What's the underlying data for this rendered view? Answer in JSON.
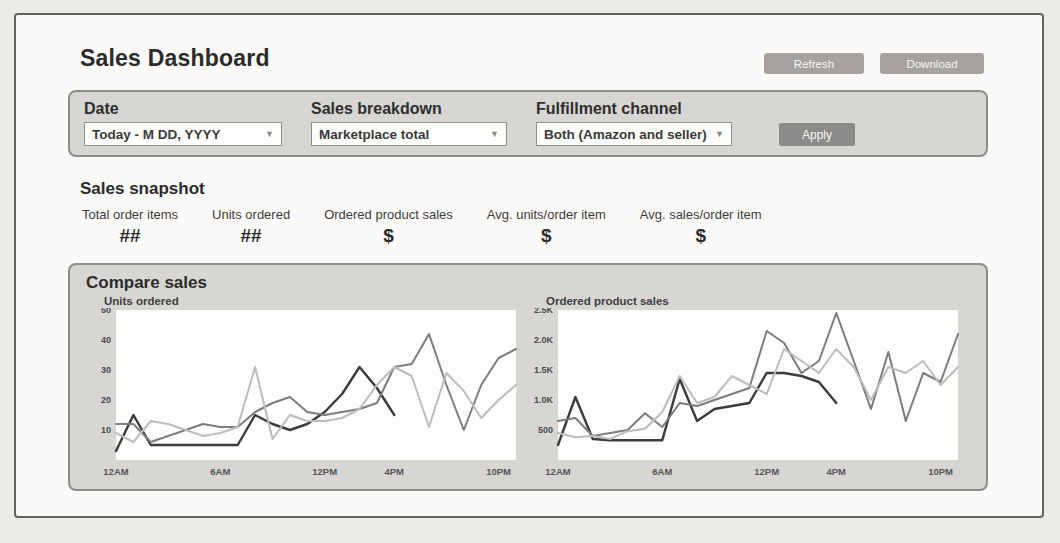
{
  "page": {
    "title": "Sales Dashboard"
  },
  "header": {
    "refresh_label": "Refresh",
    "download_label": "Download"
  },
  "filters": {
    "date": {
      "label": "Date",
      "value": "Today - M DD, YYYY"
    },
    "sales_breakdown": {
      "label": "Sales breakdown",
      "value": "Marketplace total"
    },
    "fulfillment_channel": {
      "label": "Fulfillment channel",
      "value": "Both (Amazon and seller)"
    },
    "apply_label": "Apply",
    "caret_glyph": "▼"
  },
  "snapshot": {
    "title": "Sales snapshot",
    "metrics": [
      {
        "label": "Total order items",
        "value": "##"
      },
      {
        "label": "Units ordered",
        "value": "##"
      },
      {
        "label": "Ordered product sales",
        "value": "$"
      },
      {
        "label": "Avg. units/order item",
        "value": "$"
      },
      {
        "label": "Avg. sales/order item",
        "value": "$"
      }
    ]
  },
  "compare": {
    "title": "Compare sales"
  },
  "colors": {
    "panel_bg": "#d8d6d2",
    "panel_border": "#8f8d89",
    "button_gray": "#a5a29f",
    "apply_gray": "#8d8b89",
    "line_dark": "#3b3b3b",
    "line_medium": "#7c7c7c",
    "line_light": "#bcbcbc"
  },
  "chart_data": [
    {
      "type": "line",
      "title": "Units ordered",
      "xlabel": "",
      "ylabel": "",
      "ylim": [
        0,
        50
      ],
      "x_range_hours": [
        0,
        23
      ],
      "grid": false,
      "legend": "none",
      "yticks": [
        {
          "v": 10,
          "label": "10"
        },
        {
          "v": 20,
          "label": "20"
        },
        {
          "v": 30,
          "label": "30"
        },
        {
          "v": 40,
          "label": "40"
        },
        {
          "v": 50,
          "label": "50"
        }
      ],
      "xticks": [
        {
          "h": 0,
          "label": "12AM"
        },
        {
          "h": 6,
          "label": "6AM"
        },
        {
          "h": 12,
          "label": "12PM"
        },
        {
          "h": 16,
          "label": "4PM"
        },
        {
          "h": 22,
          "label": "10PM"
        }
      ],
      "series": [
        {
          "name": "series-1-dark",
          "color": "#3b3b3b",
          "width": 2.4,
          "start_hour": 0,
          "values": [
            3,
            15,
            5,
            5,
            5,
            5,
            5,
            5,
            15,
            12,
            10,
            12,
            16,
            22,
            31,
            24,
            15
          ]
        },
        {
          "name": "series-2-medium",
          "color": "#7c7c7c",
          "width": 2,
          "start_hour": 0,
          "values": [
            12,
            12,
            6,
            8,
            10,
            12,
            11,
            11,
            16,
            19,
            21,
            16,
            15,
            16,
            17,
            19,
            31,
            32,
            42,
            25,
            10,
            25,
            34,
            37
          ]
        },
        {
          "name": "series-3-light",
          "color": "#bcbcbc",
          "width": 2,
          "start_hour": 0,
          "values": [
            9,
            6,
            13,
            12,
            10,
            8,
            9,
            11,
            31,
            7,
            15,
            13,
            13,
            14,
            17,
            25,
            31,
            28,
            11,
            29,
            23,
            14,
            20,
            25
          ]
        }
      ]
    },
    {
      "type": "line",
      "title": "Ordered product sales",
      "xlabel": "",
      "ylabel": "",
      "ylim": [
        0,
        2500
      ],
      "x_range_hours": [
        0,
        23
      ],
      "grid": false,
      "legend": "none",
      "yticks": [
        {
          "v": 500,
          "label": "500"
        },
        {
          "v": 1000,
          "label": "1.0K"
        },
        {
          "v": 1500,
          "label": "1.5K"
        },
        {
          "v": 2000,
          "label": "2.0K"
        },
        {
          "v": 2500,
          "label": "2.5K"
        }
      ],
      "xticks": [
        {
          "h": 0,
          "label": "12AM"
        },
        {
          "h": 6,
          "label": "6AM"
        },
        {
          "h": 12,
          "label": "12PM"
        },
        {
          "h": 16,
          "label": "4PM"
        },
        {
          "h": 22,
          "label": "10PM"
        }
      ],
      "series": [
        {
          "name": "series-1-dark",
          "color": "#3b3b3b",
          "width": 2.4,
          "start_hour": 0,
          "values": [
            250,
            1050,
            350,
            330,
            330,
            330,
            330,
            1350,
            650,
            850,
            900,
            950,
            1450,
            1450,
            1400,
            1300,
            950
          ]
        },
        {
          "name": "series-2-medium",
          "color": "#7c7c7c",
          "width": 2,
          "start_hour": 0,
          "values": [
            650,
            700,
            400,
            450,
            500,
            780,
            550,
            950,
            900,
            1000,
            1100,
            1200,
            2150,
            1950,
            1450,
            1650,
            2450,
            1650,
            850,
            1800,
            650,
            1450,
            1300,
            2100
          ]
        },
        {
          "name": "series-3-light",
          "color": "#bcbcbc",
          "width": 2,
          "start_hour": 0,
          "values": [
            450,
            380,
            400,
            350,
            480,
            520,
            800,
            1400,
            950,
            1050,
            1400,
            1250,
            1100,
            1850,
            1650,
            1450,
            1850,
            1550,
            1000,
            1550,
            1450,
            1650,
            1250,
            1550
          ]
        }
      ]
    }
  ]
}
